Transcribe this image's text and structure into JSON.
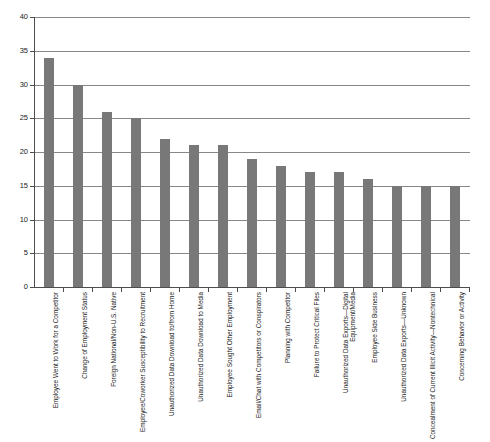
{
  "chart_data": {
    "type": "bar",
    "title": "",
    "subtitle": "",
    "xlabel": "",
    "ylabel": "",
    "ylim": [
      0,
      40
    ],
    "ytick_step": 5,
    "yticks": [
      "0",
      "5",
      "10",
      "15",
      "20",
      "25",
      "30",
      "35",
      "40"
    ],
    "grid": "horizontal",
    "legend": "none",
    "orientation": "vertical",
    "bar_color": "#787878",
    "categories": [
      "Employee Went to Work for a Competitor",
      "Change of Employment Status",
      "Foreign National/Non-U.S. Native",
      "Employee/Coworker Susceptibility to Recruitment",
      "Unauthorized Data Download to/from Home",
      "Unauthorized Data Download to Media",
      "Employee Sought Other Employment",
      "Email/Chat with Competitors or Conspirators",
      "Planning with Competitor",
      "Failure to Protect Critical Files",
      "Unauthorized Data Exports—Digital Equipment/Media",
      "Employee Side Business",
      "Unauthorized Data Exports—Unknown",
      "Concealment of Current Illicit Activity—Nontechnical",
      "Concerning Behavior or Activity"
    ],
    "values": [
      34,
      30,
      26,
      25,
      22,
      21,
      21,
      19,
      18,
      17,
      17,
      16,
      15,
      15,
      15
    ]
  },
  "colors": {
    "bar": "#787878",
    "grid": "#888888",
    "axis": "#4d4d4d",
    "text": "#1a1a1a",
    "background": "#ffffff"
  }
}
